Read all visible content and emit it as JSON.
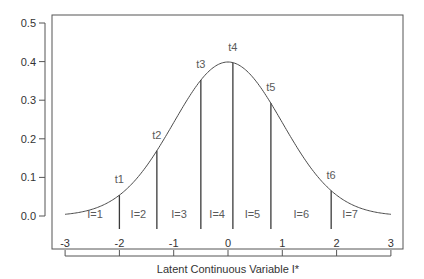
{
  "chart_data": {
    "type": "line",
    "title": "",
    "xlabel": "Latent Continuous Variable I*",
    "ylabel": "",
    "xlim": [
      -3,
      3
    ],
    "ylim": [
      0,
      0.5
    ],
    "grid": false,
    "legend": null,
    "x_ticks": [
      -3,
      -2,
      -1,
      0,
      1,
      2,
      3
    ],
    "x_tick_labels": [
      "-3",
      "-2",
      "-1",
      "0",
      "1",
      "2",
      "3"
    ],
    "y_ticks": [
      0.0,
      0.1,
      0.2,
      0.3,
      0.4,
      0.5
    ],
    "y_tick_labels": [
      "0.0",
      "0.1",
      "0.2",
      "0.3",
      "0.4",
      "0.5"
    ],
    "series": [
      {
        "name": "Standard normal density",
        "function": "dnorm(x, 0, 1)",
        "x_range": [
          -3,
          3
        ],
        "x": [
          -3,
          -2.5,
          -2,
          -1.5,
          -1,
          -0.5,
          0,
          0.5,
          1,
          1.5,
          2,
          2.5,
          3
        ],
        "y": [
          0.004,
          0.018,
          0.054,
          0.13,
          0.242,
          0.352,
          0.399,
          0.352,
          0.242,
          0.13,
          0.054,
          0.018,
          0.004
        ]
      }
    ],
    "thresholds": [
      {
        "label": "t1",
        "x": -2.0,
        "density": 0.054
      },
      {
        "label": "t2",
        "x": -1.31,
        "density": 0.169
      },
      {
        "label": "t3",
        "x": -0.5,
        "density": 0.352
      },
      {
        "label": "t4",
        "x": 0.09,
        "density": 0.397
      },
      {
        "label": "t5",
        "x": 0.79,
        "density": 0.292
      },
      {
        "label": "t6",
        "x": 1.9,
        "density": 0.066
      }
    ],
    "categories": [
      {
        "label": "I=1",
        "x": -2.45
      },
      {
        "label": "I=2",
        "x": -1.65
      },
      {
        "label": "I=3",
        "x": -0.9
      },
      {
        "label": "I=4",
        "x": -0.2
      },
      {
        "label": "I=5",
        "x": 0.45
      },
      {
        "label": "I=6",
        "x": 1.35
      },
      {
        "label": "I=7",
        "x": 2.25
      }
    ]
  },
  "colors": {
    "curve": "#4a4a4a",
    "threshold_lines": "#3a3a3a",
    "axis": "#555555",
    "annotation_text": "#5a5a5a",
    "tick_text": "#333333"
  }
}
